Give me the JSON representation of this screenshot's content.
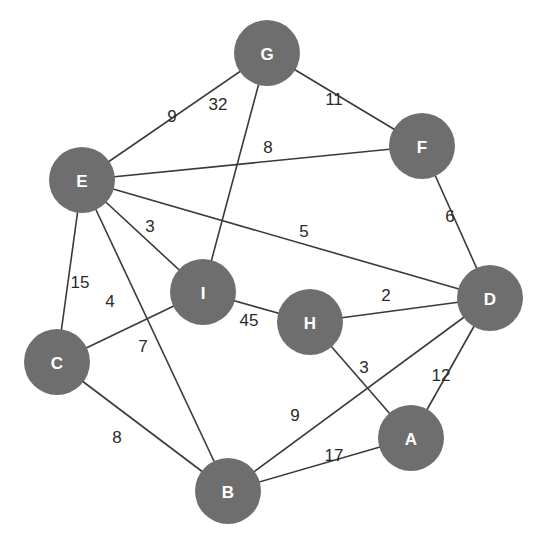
{
  "diagram": {
    "type": "weighted-undirected-graph",
    "colors": {
      "node_fill": "#6e6e6e",
      "node_text": "#ffffff",
      "edge": "#3a3a3a",
      "weight_text": "#2a2a2a",
      "background": "#ffffff"
    },
    "node_radius": 33,
    "nodes": [
      {
        "id": "G",
        "label": "G",
        "x": 267,
        "y": 53
      },
      {
        "id": "F",
        "label": "F",
        "x": 422,
        "y": 146
      },
      {
        "id": "E",
        "label": "E",
        "x": 82,
        "y": 180
      },
      {
        "id": "I",
        "label": "I",
        "x": 203,
        "y": 292
      },
      {
        "id": "H",
        "label": "H",
        "x": 310,
        "y": 322
      },
      {
        "id": "D",
        "label": "D",
        "x": 490,
        "y": 298
      },
      {
        "id": "C",
        "label": "C",
        "x": 57,
        "y": 362
      },
      {
        "id": "B",
        "label": "B",
        "x": 228,
        "y": 491
      },
      {
        "id": "A",
        "label": "A",
        "x": 411,
        "y": 438
      }
    ],
    "edges": [
      {
        "from": "E",
        "to": "G",
        "weight": "9",
        "lx": 172,
        "ly": 116
      },
      {
        "from": "G",
        "to": "I",
        "weight": "32",
        "lx": 218,
        "ly": 104
      },
      {
        "from": "G",
        "to": "F",
        "weight": "11",
        "lx": 334,
        "ly": 99
      },
      {
        "from": "E",
        "to": "F",
        "weight": "8",
        "lx": 268,
        "ly": 147
      },
      {
        "from": "F",
        "to": "D",
        "weight": "6",
        "lx": 450,
        "ly": 216
      },
      {
        "from": "E",
        "to": "I",
        "weight": "3",
        "lx": 150,
        "ly": 226
      },
      {
        "from": "E",
        "to": "D",
        "weight": "5",
        "lx": 304,
        "ly": 231
      },
      {
        "from": "E",
        "to": "C",
        "weight": "15",
        "lx": 80,
        "ly": 282
      },
      {
        "from": "C",
        "to": "I",
        "weight": "4",
        "lx": 110,
        "ly": 301
      },
      {
        "from": "E",
        "to": "B",
        "weight": "7",
        "lx": 143,
        "ly": 346
      },
      {
        "from": "I",
        "to": "H",
        "weight": "45",
        "lx": 249,
        "ly": 320
      },
      {
        "from": "H",
        "to": "D",
        "weight": "2",
        "lx": 386,
        "ly": 295
      },
      {
        "from": "H",
        "to": "A",
        "weight": "3",
        "lx": 364,
        "ly": 367
      },
      {
        "from": "D",
        "to": "A",
        "weight": "12",
        "lx": 441,
        "ly": 375
      },
      {
        "from": "B",
        "to": "D",
        "weight": "9",
        "lx": 295,
        "ly": 415
      },
      {
        "from": "C",
        "to": "B",
        "weight": "8",
        "lx": 117,
        "ly": 437
      },
      {
        "from": "B",
        "to": "A",
        "weight": "17",
        "lx": 334,
        "ly": 455
      }
    ]
  }
}
